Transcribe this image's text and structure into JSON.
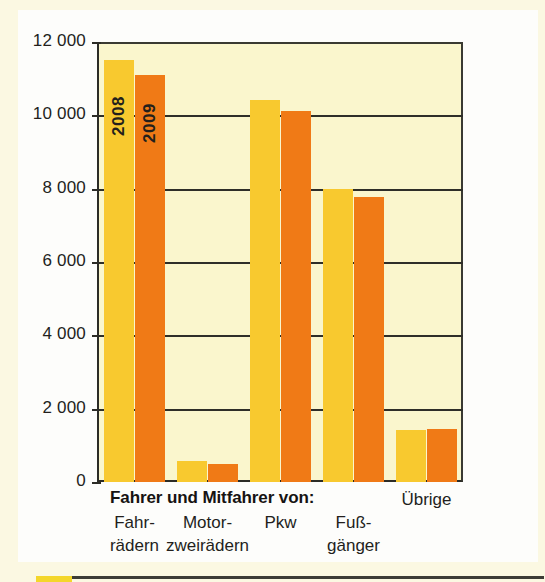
{
  "chart_data": {
    "type": "bar",
    "title": "",
    "xlabel": "",
    "ylabel": "",
    "ylim": [
      0,
      12000
    ],
    "grid": true,
    "legend_position": "on-bars",
    "group_header": "Fahrer und Mitfahrer von:",
    "categories": [
      {
        "line1": "Fahr-",
        "line2": "rädern"
      },
      {
        "line1": "Motor-",
        "line2": "zweirädern"
      },
      {
        "line1": "Pkw",
        "line2": ""
      },
      {
        "line1": "Fuß-",
        "line2": "gänger"
      },
      {
        "line1": "Übrige",
        "line2": ""
      }
    ],
    "series": [
      {
        "name": "2008",
        "color": "#f8c92f",
        "values": [
          11500,
          580,
          10420,
          7990,
          1430
        ]
      },
      {
        "name": "2009",
        "color": "#f07a16",
        "values": [
          11100,
          500,
          10120,
          7780,
          1440
        ]
      }
    ],
    "yticks": [
      {
        "value": 12000,
        "label": "12 000"
      },
      {
        "value": 10000,
        "label": "10 000"
      },
      {
        "value": 8000,
        "label": "8 000"
      },
      {
        "value": 6000,
        "label": "6 000"
      },
      {
        "value": 4000,
        "label": "4 000"
      },
      {
        "value": 2000,
        "label": "2 000"
      },
      {
        "value": 0,
        "label": "0"
      }
    ],
    "colors": {
      "plot_background": "#faf6cd",
      "page_background": "#fbf8e2",
      "card_background": "#fdfdfb",
      "axis": "#2c2c26",
      "text": "#231f1c",
      "footer_swatch": "#f4d62a",
      "footer_rule": "#3c3c36"
    }
  }
}
